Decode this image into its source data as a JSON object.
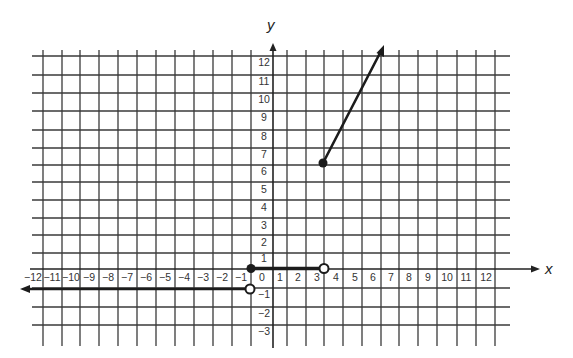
{
  "chart_data": {
    "type": "line",
    "title": "",
    "xlabel": "x",
    "ylabel": "y",
    "xlim": [
      -12,
      12
    ],
    "ylim": [
      -3,
      12
    ],
    "grid": true,
    "x_tick_labels": [
      "−12",
      "−11",
      "−10",
      "−9",
      "−8",
      "−7",
      "−6",
      "−5",
      "−4",
      "−3",
      "−2",
      "−1",
      "0",
      "1",
      "2",
      "3",
      "4",
      "5",
      "6",
      "7",
      "8",
      "9",
      "10",
      "11",
      "12"
    ],
    "y_tick_labels": [
      "12",
      "11",
      "10",
      "9",
      "8",
      "7",
      "6",
      "5",
      "4",
      "3",
      "2",
      "1",
      "−1",
      "−2",
      "−3"
    ],
    "series": [
      {
        "name": "piece-left-ray",
        "description": "horizontal ray to the left",
        "points": [
          [
            -12.5,
            -1
          ],
          [
            -1,
            -1
          ]
        ],
        "start_endpoint": "arrow",
        "end_endpoint": "open"
      },
      {
        "name": "piece-middle-segment",
        "description": "horizontal segment",
        "points": [
          [
            -1,
            0
          ],
          [
            3,
            0
          ]
        ],
        "start_endpoint": "closed",
        "end_endpoint": "open"
      },
      {
        "name": "piece-right-ray",
        "description": "increasing ray",
        "points": [
          [
            3,
            6
          ],
          [
            6,
            12
          ]
        ],
        "start_endpoint": "closed",
        "end_endpoint": "arrow"
      }
    ]
  },
  "labels": {
    "x_axis": "x",
    "y_axis": "y"
  }
}
